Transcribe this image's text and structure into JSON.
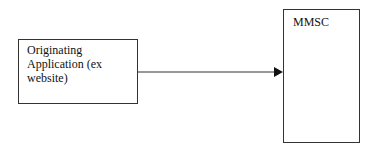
{
  "diagram": {
    "nodes": [
      {
        "id": "originating-application",
        "label_lines": [
          "Originating",
          "Application (ex",
          "website)"
        ]
      },
      {
        "id": "mmsc",
        "label_lines": [
          "MMSC"
        ]
      }
    ],
    "edges": [
      {
        "from": "originating-application",
        "to": "mmsc",
        "style": "solid-arrow"
      }
    ],
    "colors": {
      "stroke": "#333333",
      "text": "#111111",
      "background": "#ffffff"
    }
  }
}
